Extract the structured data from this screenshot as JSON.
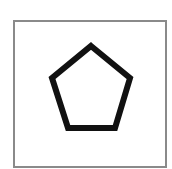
{
  "figure": {
    "frame": {
      "x": 14,
      "y": 21,
      "width": 152,
      "height": 146,
      "stroke": "#8a8a8a",
      "stroke_width": 2
    },
    "shape": {
      "type": "pentagon",
      "points": "91,46 130,78 115,128 68,128 52,78",
      "stroke": "#111111",
      "stroke_width": 6,
      "fill": "#ffffff"
    }
  }
}
